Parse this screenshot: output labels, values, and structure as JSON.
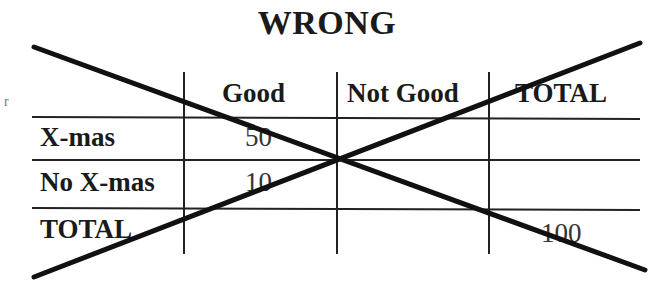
{
  "title": "WRONG",
  "side_mark": "r",
  "table": {
    "columns": [
      "",
      "Good",
      "Not Good",
      "TOTAL"
    ],
    "rows": [
      {
        "label": "X-mas",
        "cells": [
          "50",
          "",
          ""
        ]
      },
      {
        "label": "No X-mas",
        "cells": [
          "10",
          "",
          ""
        ]
      },
      {
        "label": "TOTAL",
        "cells": [
          "",
          "",
          "100"
        ]
      }
    ]
  },
  "annotation": {
    "type": "cross-out",
    "description": "Large X drawn across the whole table"
  },
  "colors": {
    "ink": "#1a1a1a",
    "background": "#ffffff"
  }
}
